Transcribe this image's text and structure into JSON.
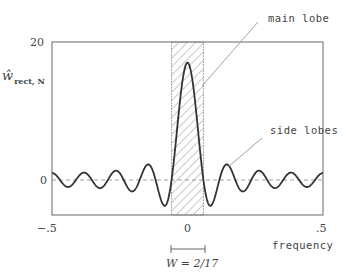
{
  "chart_data": {
    "type": "line",
    "title": "",
    "xlabel": "frequency",
    "ylabel": "ŵ rect, N",
    "xlim": [
      -0.5,
      0.5
    ],
    "ylim": [
      -4,
      20
    ],
    "x_ticks": [
      "-.5",
      "0",
      ".5"
    ],
    "y_ticks": [
      "0",
      "20"
    ],
    "grid": false,
    "reference_lines": [
      {
        "type": "horizontal",
        "y": 0,
        "style": "dashed"
      }
    ],
    "shaded_region": {
      "x_from": -0.0588,
      "x_to": 0.0588,
      "style": "hatched",
      "label": "W = 2/17"
    },
    "N": 17,
    "series": [
      {
        "name": "Dirichlet kernel (rectangular window, N=17)",
        "formula": "sin(pi*N*f)/sin(pi*f)",
        "peak": 17
      }
    ],
    "annotations": [
      {
        "text": "main lobe",
        "points_to": "main lobe of kernel"
      },
      {
        "text": "side lobes",
        "points_to": "first side lobe"
      },
      {
        "text": "W = 2/17",
        "points_to": "main lobe width"
      }
    ]
  },
  "labels": {
    "ylabel_hat": "ŵ",
    "ylabel_sub": "rect, N",
    "ytick_top": "20",
    "ytick_zero": "0",
    "xtick_left": "−.5",
    "xtick_mid": "0",
    "xtick_right": ".5",
    "xlabel": "frequency",
    "main_lobe": "main lobe",
    "side_lobes": "side lobes",
    "width_label": "W = 2/17"
  }
}
